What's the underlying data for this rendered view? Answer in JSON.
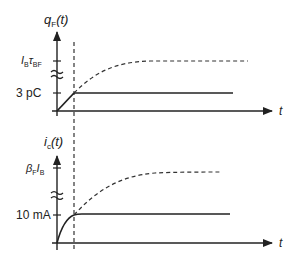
{
  "top_plot": {
    "y_label": "q",
    "y_label_sub": "F",
    "y_label_arg": "(t)",
    "upper_tick_label_main": "I",
    "upper_tick_label_sub1": "B",
    "upper_tick_label_tau": "τ",
    "upper_tick_label_sub2": "BF",
    "lower_tick_label": "3 pC",
    "x_label": "t"
  },
  "bottom_plot": {
    "y_label": "i",
    "y_label_sub": "c",
    "y_label_arg": "(t)",
    "upper_tick_label_beta": "β",
    "upper_tick_label_sub1": "F",
    "upper_tick_label_I": "I",
    "upper_tick_label_sub2": "B",
    "lower_tick_label": "10 mA",
    "x_label": "t"
  },
  "colors": {
    "line": "#222222",
    "background": "#ffffff"
  }
}
